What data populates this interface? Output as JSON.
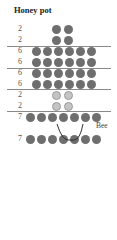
{
  "title": "Honey pot",
  "bee_label": "Bee",
  "colors": {
    "dot": "#6e6e6e",
    "dot_light": "#c4c4c4",
    "separator": "#8a8a8a"
  },
  "rows": [
    {
      "label": "2",
      "count": 2,
      "style": "dark"
    },
    {
      "label": "2",
      "count": 2,
      "style": "dark"
    },
    {
      "label": "6",
      "count": 6,
      "style": "dark"
    },
    {
      "label": "6",
      "count": 6,
      "style": "dark"
    },
    {
      "label": "6",
      "count": 6,
      "style": "dark"
    },
    {
      "label": "6",
      "count": 6,
      "style": "dark"
    },
    {
      "label": "2",
      "count": 2,
      "style": "light"
    },
    {
      "label": "2",
      "count": 2,
      "style": "light"
    },
    {
      "label": "7",
      "count": 7,
      "style": "dark"
    },
    {
      "label": "7",
      "count": 7,
      "style": "dark"
    }
  ]
}
